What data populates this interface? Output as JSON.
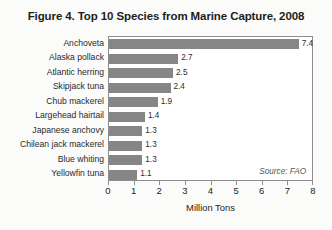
{
  "figure": {
    "title": "Figure 4. Top 10 Species from Marine Capture, 2008",
    "source_note": "Source: FAO",
    "background_color": "#fbfbfa",
    "bar_color": "#868686",
    "frame_color": "#8d8d8d",
    "text_color": "#1d1d1d"
  },
  "chart_data": {
    "type": "bar",
    "orientation": "horizontal",
    "title": "Figure 4. Top 10 Species from Marine Capture, 2008",
    "xlabel": "Million Tons",
    "ylabel": "",
    "xlim": [
      0,
      8
    ],
    "xticks": [
      0,
      1,
      2,
      3,
      4,
      5,
      6,
      7,
      8
    ],
    "xtick_labels": [
      "0",
      "1",
      "2",
      "3",
      "4",
      "5",
      "6",
      "7",
      "8"
    ],
    "grid": false,
    "legend": false,
    "categories": [
      "Anchoveta",
      "Alaska pollack",
      "Atlantic herring",
      "Skipjack tuna",
      "Chub mackerel",
      "Largehead hairtail",
      "Japanese anchovy",
      "Chilean jack mackerel",
      "Blue whiting",
      "Yellowfin tuna"
    ],
    "values": [
      7.4,
      2.7,
      2.5,
      2.4,
      1.9,
      1.4,
      1.3,
      1.3,
      1.3,
      1.1
    ],
    "data_labels": [
      "7.4",
      "2.7",
      "2.5",
      "2.4",
      "1.9",
      "1.4",
      "1.3",
      "1.3",
      "1.3",
      "1.1"
    ],
    "annotations": [
      "Source: FAO"
    ]
  }
}
